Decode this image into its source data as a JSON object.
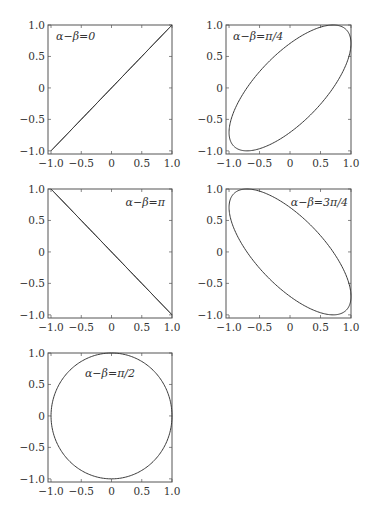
{
  "figure": {
    "layout": {
      "rows": 3,
      "cols": 2,
      "panel_count": 5
    },
    "colors": {
      "line": "#3a3a3a",
      "axes": "#555555",
      "text": "#333333",
      "background": "#ffffff"
    }
  },
  "chart_data": [
    {
      "type": "line",
      "title": "",
      "annotation": "α−β=0",
      "annotation_position": "top-left",
      "curve": "x = cos(t), y = cos(t + 0)",
      "phase_difference": "0",
      "x_range": [
        -1.0,
        1.0
      ],
      "y_range": [
        -1.0,
        1.0
      ],
      "xlim": [
        -1.05,
        1.0
      ],
      "ylim": [
        -1.05,
        1.0
      ],
      "xticks": [
        "−1.0",
        "−0.5",
        "0",
        "0.5",
        "1.0"
      ],
      "yticks": [
        "−1.0",
        "−0.5",
        "0",
        "0.5",
        "1.0"
      ],
      "xlabel": "",
      "ylabel": "",
      "grid": false,
      "legend": "none",
      "shape": "diagonal line from (-1,-1) to (1,1)"
    },
    {
      "type": "line",
      "title": "",
      "annotation": "α−β=π/4",
      "annotation_position": "top-left",
      "curve": "x = cos(t), y = cos(t + π/4)",
      "phase_difference": "π/4",
      "xlim": [
        -1.05,
        1.0
      ],
      "ylim": [
        -1.05,
        1.0
      ],
      "xticks": [
        "−1.0",
        "−0.5",
        "0",
        "0.5",
        "1.0"
      ],
      "yticks": [
        "−1.0",
        "−0.5",
        "0",
        "0.5",
        "1.0"
      ],
      "xlabel": "",
      "ylabel": "",
      "grid": false,
      "legend": "none",
      "shape": "ellipse tilted along y=x"
    },
    {
      "type": "line",
      "title": "",
      "annotation": "α−β=π",
      "annotation_position": "top-right",
      "curve": "x = cos(t), y = cos(t + π)",
      "phase_difference": "π",
      "xlim": [
        -1.05,
        1.0
      ],
      "ylim": [
        -1.05,
        1.0
      ],
      "xticks": [
        "−1.0",
        "−0.5",
        "0",
        "0.5",
        "1.0"
      ],
      "yticks": [
        "−1.0",
        "−0.5",
        "0",
        "0.5",
        "1.0"
      ],
      "xlabel": "",
      "ylabel": "",
      "grid": false,
      "legend": "none",
      "shape": "diagonal line from (-1,1) to (1,-1)"
    },
    {
      "type": "line",
      "title": "",
      "annotation": "α−β=3π/4",
      "annotation_position": "top-right",
      "curve": "x = cos(t), y = cos(t + 3π/4)",
      "phase_difference": "3π/4",
      "xlim": [
        -1.05,
        1.0
      ],
      "ylim": [
        -1.05,
        1.0
      ],
      "xticks": [
        "−1.0",
        "−0.5",
        "0",
        "0.5",
        "1.0"
      ],
      "yticks": [
        "−1.0",
        "−0.5",
        "0",
        "0.5",
        "1.0"
      ],
      "xlabel": "",
      "ylabel": "",
      "grid": false,
      "legend": "none",
      "shape": "ellipse tilted along y=-x"
    },
    {
      "type": "line",
      "title": "",
      "annotation": "α−β=π/2",
      "annotation_position": "top-center",
      "curve": "x = cos(t), y = cos(t + π/2)",
      "phase_difference": "π/2",
      "xlim": [
        -1.05,
        1.0
      ],
      "ylim": [
        -1.05,
        1.0
      ],
      "xticks": [
        "−1.0",
        "−0.5",
        "0",
        "0.5",
        "1.0"
      ],
      "yticks": [
        "−1.0",
        "−0.5",
        "0",
        "0.5",
        "1.0"
      ],
      "xlabel": "",
      "ylabel": "",
      "grid": false,
      "legend": "none",
      "shape": "circle of radius 1"
    }
  ],
  "panels": [
    {
      "id": "p1",
      "annotation": "α−β=0",
      "phase": 0,
      "left": 48,
      "top": 25,
      "right": 172,
      "bottom": 154,
      "annot_x": 56,
      "annot_y": 40,
      "annot_anchor": "start"
    },
    {
      "id": "p2",
      "annotation": "α−β=π/4",
      "phase": 0.7853981634,
      "left": 226,
      "top": 25,
      "right": 351,
      "bottom": 154,
      "annot_x": 233,
      "annot_y": 40,
      "annot_anchor": "start"
    },
    {
      "id": "p3",
      "annotation": "α−β=π",
      "phase": 3.1415926536,
      "left": 48,
      "top": 189,
      "right": 172,
      "bottom": 318,
      "annot_x": 165,
      "annot_y": 206,
      "annot_anchor": "end"
    },
    {
      "id": "p4",
      "annotation": "α−β=3π/4",
      "phase": 2.3561944902,
      "left": 226,
      "top": 189,
      "right": 351,
      "bottom": 318,
      "annot_x": 348,
      "annot_y": 206,
      "annot_anchor": "end"
    },
    {
      "id": "p5",
      "annotation": "α−β=π/2",
      "phase": 1.5707963268,
      "left": 48,
      "top": 353,
      "right": 172,
      "bottom": 482,
      "annot_x": 110,
      "annot_y": 377,
      "annot_anchor": "middle"
    }
  ],
  "tick_values": [
    -1.0,
    -0.5,
    0,
    0.5,
    1.0
  ],
  "tick_labels": [
    "−1.0",
    "−0.5",
    "0",
    "0.5",
    "1.0"
  ],
  "caption": ""
}
